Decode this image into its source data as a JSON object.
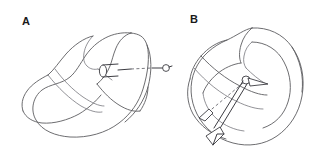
{
  "figure": {
    "type": "line-art-anatomical-diagram",
    "background_color": "#ffffff",
    "outline_color": "#5c5c60",
    "arrow_color": "#3c3c42",
    "label_color": "#1a1a1a",
    "width": 328,
    "height": 158,
    "panel_count": 2
  },
  "panels": [
    {
      "id": "panel-a",
      "label": "A",
      "label_position": {
        "x": 22,
        "y": 22
      },
      "annotation": {
        "name": "horizontal-probe-arrow",
        "style": "solid-and-dashed",
        "direction": "rightward",
        "tail_marker": "cylinder-tube",
        "head_marker": "small-ring",
        "from": {
          "x": 99,
          "y": 72
        },
        "to": {
          "x": 168,
          "y": 70
        }
      },
      "shape": {
        "name": "meniscus-outline-lateral-view",
        "orientation": "lateral"
      }
    },
    {
      "id": "panel-b",
      "label": "B",
      "label_position": {
        "x": 190,
        "y": 20
      },
      "annotation": {
        "name": "double-headed-vector-arrow",
        "style": "solid-with-dashed-reference",
        "direction": "diagonal-down-left",
        "pivot": {
          "x": 246,
          "y": 80
        },
        "arrowhead_count": 2,
        "arrowheads": [
          {
            "x": 202,
            "y": 116
          },
          {
            "x": 214,
            "y": 137
          }
        ]
      },
      "shape": {
        "name": "meniscus-outline-rotated-view",
        "orientation": "rotated"
      }
    }
  ]
}
